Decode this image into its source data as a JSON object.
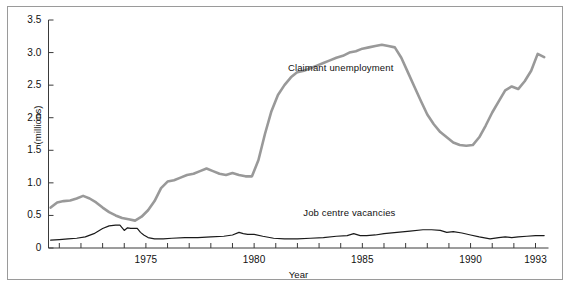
{
  "chart_data": {
    "type": "line",
    "title": "",
    "xlabel": "Year",
    "ylabel": "(millions)",
    "xlim": [
      1970.5,
      1993.6
    ],
    "ylim": [
      0,
      3.5
    ],
    "grid": false,
    "legend_position": "inline-annotation",
    "y_ticks": [
      "0",
      "0.5",
      "1.0",
      "1.5",
      "2.0",
      "2.5",
      "3.0",
      "3.5"
    ],
    "y_tick_values": [
      0,
      0.5,
      1.0,
      1.5,
      2.0,
      2.5,
      3.0,
      3.5
    ],
    "x_ticks_labeled": [
      "1975",
      "1980",
      "1985",
      "1990",
      "1993"
    ],
    "x_tick_values": [
      1971,
      1972,
      1973,
      1974,
      1975,
      1976,
      1977,
      1978,
      1979,
      1980,
      1981,
      1982,
      1983,
      1984,
      1985,
      1986,
      1987,
      1988,
      1989,
      1990,
      1991,
      1992,
      1993
    ],
    "annotations": [
      {
        "text": "Claimant unemployment",
        "x": 1984.0,
        "y": 2.75
      },
      {
        "text": "Job centre vacancies",
        "x": 1984.4,
        "y": 0.52
      }
    ],
    "series": [
      {
        "name": "Claimant unemployment",
        "color": "#999999",
        "width": 2.6,
        "x": [
          1970.6,
          1970.9,
          1971.2,
          1971.5,
          1971.8,
          1972.1,
          1972.4,
          1972.7,
          1973.0,
          1973.3,
          1973.6,
          1973.9,
          1974.2,
          1974.5,
          1974.8,
          1975.1,
          1975.4,
          1975.7,
          1976.0,
          1976.3,
          1976.6,
          1976.9,
          1977.2,
          1977.5,
          1977.8,
          1978.1,
          1978.4,
          1978.7,
          1979.0,
          1979.3,
          1979.6,
          1979.9,
          1980.2,
          1980.5,
          1980.8,
          1981.1,
          1981.4,
          1981.7,
          1982.0,
          1982.3,
          1982.6,
          1982.9,
          1983.2,
          1983.5,
          1983.8,
          1984.1,
          1984.4,
          1984.7,
          1985.0,
          1985.3,
          1985.6,
          1985.9,
          1986.2,
          1986.5,
          1986.8,
          1987.1,
          1987.4,
          1987.7,
          1988.0,
          1988.3,
          1988.6,
          1988.9,
          1989.2,
          1989.5,
          1989.8,
          1990.1,
          1990.4,
          1990.7,
          1991.0,
          1991.3,
          1991.6,
          1991.9,
          1992.2,
          1992.5,
          1992.8,
          1993.1,
          1993.4
        ],
        "y": [
          0.62,
          0.7,
          0.72,
          0.73,
          0.76,
          0.8,
          0.76,
          0.7,
          0.62,
          0.55,
          0.5,
          0.46,
          0.44,
          0.42,
          0.48,
          0.58,
          0.72,
          0.92,
          1.02,
          1.04,
          1.08,
          1.12,
          1.14,
          1.18,
          1.22,
          1.18,
          1.14,
          1.12,
          1.15,
          1.12,
          1.1,
          1.1,
          1.35,
          1.75,
          2.1,
          2.35,
          2.5,
          2.62,
          2.7,
          2.72,
          2.76,
          2.8,
          2.84,
          2.88,
          2.92,
          2.95,
          3.0,
          3.02,
          3.06,
          3.08,
          3.1,
          3.12,
          3.1,
          3.08,
          2.92,
          2.7,
          2.48,
          2.26,
          2.05,
          1.9,
          1.78,
          1.7,
          1.62,
          1.58,
          1.57,
          1.58,
          1.7,
          1.88,
          2.08,
          2.25,
          2.42,
          2.48,
          2.44,
          2.56,
          2.72,
          2.98,
          2.93
        ]
      },
      {
        "name": "Job centre vacancies",
        "color": "#1a1a1a",
        "width": 1.2,
        "x": [
          1970.6,
          1971.0,
          1971.4,
          1971.8,
          1972.2,
          1972.6,
          1973.0,
          1973.3,
          1973.6,
          1973.8,
          1974.0,
          1974.15,
          1974.3,
          1974.45,
          1974.6,
          1974.75,
          1974.9,
          1975.1,
          1975.4,
          1975.8,
          1976.2,
          1976.8,
          1977.4,
          1978.0,
          1978.6,
          1979.0,
          1979.3,
          1979.5,
          1979.7,
          1980.0,
          1980.4,
          1980.9,
          1981.4,
          1982.0,
          1982.6,
          1983.2,
          1983.8,
          1984.3,
          1984.6,
          1984.9,
          1985.2,
          1985.6,
          1986.0,
          1986.6,
          1987.2,
          1987.8,
          1988.2,
          1988.6,
          1988.9,
          1989.2,
          1989.6,
          1990.0,
          1990.4,
          1990.9,
          1991.3,
          1991.6,
          1991.9,
          1992.2,
          1992.6,
          1993.0,
          1993.4
        ],
        "y": [
          0.12,
          0.13,
          0.14,
          0.15,
          0.17,
          0.22,
          0.3,
          0.34,
          0.35,
          0.35,
          0.27,
          0.31,
          0.3,
          0.3,
          0.3,
          0.24,
          0.2,
          0.16,
          0.14,
          0.14,
          0.15,
          0.16,
          0.16,
          0.17,
          0.18,
          0.2,
          0.24,
          0.22,
          0.21,
          0.21,
          0.18,
          0.15,
          0.14,
          0.14,
          0.15,
          0.16,
          0.18,
          0.19,
          0.22,
          0.19,
          0.19,
          0.2,
          0.22,
          0.24,
          0.26,
          0.28,
          0.28,
          0.27,
          0.24,
          0.25,
          0.23,
          0.2,
          0.17,
          0.14,
          0.16,
          0.17,
          0.16,
          0.17,
          0.18,
          0.19,
          0.19
        ]
      }
    ]
  }
}
